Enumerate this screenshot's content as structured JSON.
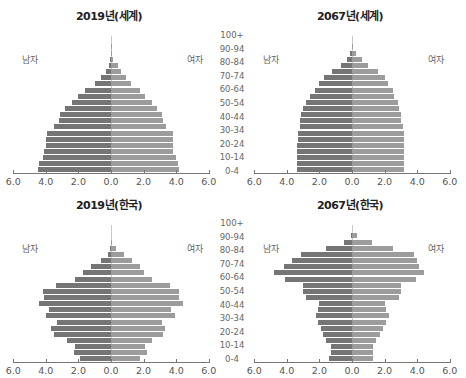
{
  "age_groups": [
    "0-4",
    "5-9",
    "10-14",
    "15-19",
    "20-24",
    "25-29",
    "30-34",
    "35-39",
    "40-44",
    "45-49",
    "50-54",
    "55-59",
    "60-64",
    "65-69",
    "70-74",
    "75-79",
    "80-84",
    "85-89",
    "90-94",
    "95-99",
    "100+"
  ],
  "age_labels_shown": [
    "100+",
    "90-94",
    "80-84",
    "70-74",
    "60-64",
    "50-54",
    "40-44",
    "30-34",
    "20-24",
    "10-14",
    "0-4"
  ],
  "sex_labels": {
    "male": "남자",
    "female": "여자"
  },
  "colors": {
    "male": "#757575",
    "female": "#9c9c9c",
    "axis": "#777777"
  },
  "chart_data": [
    {
      "type": "bar",
      "subtype": "population-pyramid",
      "title": "2019년(세계)",
      "xlabel": "",
      "ylabel": "",
      "xlim": [
        -6.0,
        6.0
      ],
      "x_ticks": [
        "6.0",
        "4.0",
        "2.0",
        "0.0",
        "2.0",
        "4.0",
        "6.0"
      ],
      "legend": [
        "남자",
        "여자"
      ],
      "categories": [
        "0-4",
        "5-9",
        "10-14",
        "15-19",
        "20-24",
        "25-29",
        "30-34",
        "35-39",
        "40-44",
        "45-49",
        "50-54",
        "55-59",
        "60-64",
        "65-69",
        "70-74",
        "75-79",
        "80-84",
        "85-89",
        "90-94",
        "95-99",
        "100+"
      ],
      "series": [
        {
          "name": "남자",
          "values": [
            4.5,
            4.4,
            4.2,
            4.1,
            4.0,
            4.0,
            3.9,
            3.5,
            3.2,
            3.1,
            2.8,
            2.4,
            2.0,
            1.6,
            1.0,
            0.6,
            0.3,
            0.1,
            0.05,
            0.02,
            0.0
          ]
        },
        {
          "name": "여자",
          "values": [
            4.2,
            4.1,
            4.0,
            3.8,
            3.8,
            3.8,
            3.8,
            3.4,
            3.2,
            3.1,
            2.8,
            2.5,
            2.1,
            1.8,
            1.2,
            0.9,
            0.6,
            0.4,
            0.15,
            0.05,
            0.01
          ]
        }
      ]
    },
    {
      "type": "bar",
      "subtype": "population-pyramid",
      "title": "2067년(세계)",
      "xlabel": "",
      "ylabel": "",
      "xlim": [
        -6.0,
        6.0
      ],
      "x_ticks": [
        "6.0",
        "4.0",
        "2.0",
        "0.0",
        "2.0",
        "4.0",
        "6.0"
      ],
      "legend": [
        "남자",
        "여자"
      ],
      "categories": [
        "0-4",
        "5-9",
        "10-14",
        "15-19",
        "20-24",
        "25-29",
        "30-34",
        "35-39",
        "40-44",
        "45-49",
        "50-54",
        "55-59",
        "60-64",
        "65-69",
        "70-74",
        "75-79",
        "80-84",
        "85-89",
        "90-94",
        "95-99",
        "100+"
      ],
      "series": [
        {
          "name": "남자",
          "values": [
            3.4,
            3.4,
            3.4,
            3.4,
            3.4,
            3.3,
            3.3,
            3.2,
            3.2,
            3.1,
            3.0,
            2.8,
            2.6,
            2.3,
            2.0,
            1.7,
            1.2,
            0.7,
            0.3,
            0.1,
            0.0
          ]
        },
        {
          "name": "여자",
          "values": [
            3.2,
            3.2,
            3.2,
            3.2,
            3.2,
            3.2,
            3.2,
            3.1,
            3.0,
            3.0,
            2.9,
            2.8,
            2.6,
            2.5,
            2.2,
            2.0,
            1.6,
            1.0,
            0.6,
            0.25,
            0.05
          ]
        }
      ]
    },
    {
      "type": "bar",
      "subtype": "population-pyramid",
      "title": "2019년(한국)",
      "xlabel": "",
      "ylabel": "",
      "xlim": [
        -6.0,
        6.0
      ],
      "x_ticks": [
        "6.0",
        "4.0",
        "2.0",
        "0.0",
        "2.0",
        "4.0",
        "6.0"
      ],
      "legend": [
        "남자",
        "여자"
      ],
      "categories": [
        "0-4",
        "5-9",
        "10-14",
        "15-19",
        "20-24",
        "25-29",
        "30-34",
        "35-39",
        "40-44",
        "45-49",
        "50-54",
        "55-59",
        "60-64",
        "65-69",
        "70-74",
        "75-79",
        "80-84",
        "85-89",
        "90-94",
        "95-99",
        "100+"
      ],
      "series": [
        {
          "name": "남자",
          "values": [
            1.9,
            2.3,
            2.2,
            2.7,
            3.5,
            3.7,
            3.3,
            4.0,
            3.8,
            4.4,
            4.1,
            4.2,
            3.4,
            2.2,
            1.7,
            1.2,
            0.6,
            0.2,
            0.05,
            0.0,
            0.0
          ]
        },
        {
          "name": "여자",
          "values": [
            1.8,
            2.2,
            2.1,
            2.5,
            3.2,
            3.3,
            3.1,
            3.9,
            3.7,
            4.4,
            4.2,
            4.2,
            3.6,
            2.5,
            2.0,
            1.8,
            1.3,
            0.8,
            0.3,
            0.05,
            0.0
          ]
        }
      ]
    },
    {
      "type": "bar",
      "subtype": "population-pyramid",
      "title": "2067년(한국)",
      "xlabel": "",
      "ylabel": "",
      "xlim": [
        -6.0,
        6.0
      ],
      "x_ticks": [
        "6.0",
        "4.0",
        "2.0",
        "0.0",
        "2.0",
        "4.0",
        "6.0"
      ],
      "legend": [
        "남자",
        "여자"
      ],
      "categories": [
        "0-4",
        "5-9",
        "10-14",
        "15-19",
        "20-24",
        "25-29",
        "30-34",
        "35-39",
        "40-44",
        "45-49",
        "50-54",
        "55-59",
        "60-64",
        "65-69",
        "70-74",
        "75-79",
        "80-84",
        "85-89",
        "90-94",
        "95-99",
        "100+"
      ],
      "series": [
        {
          "name": "남자",
          "values": [
            1.4,
            1.3,
            1.3,
            1.6,
            1.8,
            1.9,
            2.1,
            2.2,
            2.1,
            2.0,
            2.8,
            3.0,
            3.0,
            4.1,
            4.8,
            4.2,
            3.7,
            3.1,
            1.6,
            0.5,
            0.05
          ]
        },
        {
          "name": "여자",
          "values": [
            1.3,
            1.3,
            1.3,
            1.5,
            1.7,
            1.9,
            2.1,
            2.3,
            2.1,
            2.0,
            2.9,
            3.0,
            3.0,
            3.9,
            4.4,
            4.1,
            4.0,
            3.8,
            2.5,
            1.2,
            0.3
          ]
        }
      ]
    }
  ]
}
